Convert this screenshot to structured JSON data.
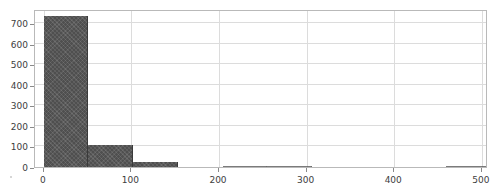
{
  "chart_data": {
    "type": "bar",
    "title": "",
    "subtitle": "",
    "xlabel": "",
    "ylabel": "",
    "grid": true,
    "legend": null,
    "legend_position": "none",
    "bar_color": "#4f4f4f",
    "frame_color": "#b9b9b9",
    "grid_color": "#dcdcdc",
    "background": "#ffffff",
    "xlim": [
      -10,
      507
    ],
    "ylim": [
      0,
      770
    ],
    "xticks": [
      0,
      100,
      200,
      300,
      400,
      500
    ],
    "xtick_labels": [
      "0",
      "100",
      "200",
      "300",
      "400",
      "500"
    ],
    "yticks": [
      0,
      100,
      200,
      300,
      400,
      500,
      600,
      700
    ],
    "ytick_labels": [
      "0",
      "100",
      "200",
      "300",
      "400",
      "500",
      "600",
      "700"
    ],
    "bin_width": 51,
    "bins": [
      {
        "x0": 0,
        "x1": 51,
        "value": 735
      },
      {
        "x0": 51,
        "x1": 102,
        "value": 105
      },
      {
        "x0": 102,
        "x1": 153,
        "value": 25
      },
      {
        "x0": 153,
        "x1": 204,
        "value": 0
      },
      {
        "x0": 204,
        "x1": 255,
        "value": 6
      },
      {
        "x0": 255,
        "x1": 306,
        "value": 4
      },
      {
        "x0": 306,
        "x1": 357,
        "value": 0
      },
      {
        "x0": 357,
        "x1": 408,
        "value": 0
      },
      {
        "x0": 408,
        "x1": 459,
        "value": 0
      },
      {
        "x0": 459,
        "x1": 510,
        "value": 2
      }
    ],
    "categories": [
      "0-51",
      "51-102",
      "102-153",
      "153-204",
      "204-255",
      "255-306",
      "306-357",
      "357-408",
      "408-459",
      "459-510"
    ],
    "values": [
      735,
      105,
      25,
      0,
      6,
      4,
      0,
      0,
      0,
      2
    ]
  }
}
